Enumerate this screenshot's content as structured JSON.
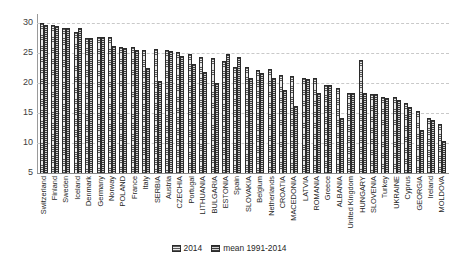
{
  "chart_data": {
    "type": "bar",
    "title": "",
    "subtitle": "",
    "xlabel": "",
    "ylabel": "",
    "ylim": [
      5,
      30
    ],
    "yticks": [
      30,
      25,
      20,
      15,
      10,
      5
    ],
    "grid": true,
    "legend_position": "bottom",
    "categories": [
      "Switzerland",
      "Finland",
      "Sweden",
      "Iceland",
      "Denmark",
      "Germany",
      "Norway",
      "POLAND",
      "France",
      "Italy",
      "SERBIA",
      "Austria",
      "CZECHIA",
      "Portugal",
      "LITHUANIA",
      "BULGARIA",
      "ESTONIA",
      "Spain",
      "SLOVAKIA",
      "Belgium",
      "Netherlands",
      "CROATIA",
      "MACEDONIA",
      "LATVIA",
      "ROMANIA",
      "Greece",
      "ALBANIA",
      "United Kingdom",
      "HUNGARY",
      "SLOVENIA",
      "Turkey",
      "UKRAINE",
      "Cyprus",
      "GEORGIA",
      "Ireland",
      "MOLDOVA"
    ],
    "series": [
      {
        "name": "2014",
        "color": "#e9e9e9",
        "values": [
          30.0,
          29.6,
          29.1,
          28.5,
          27.5,
          27.6,
          27.6,
          26.0,
          26.0,
          25.5,
          25.6,
          25.5,
          25.2,
          24.8,
          24.3,
          24.1,
          23.6,
          22.7,
          22.7,
          22.2,
          22.3,
          21.3,
          21.2,
          20.9,
          20.8,
          19.6,
          19.1,
          18.4,
          23.8,
          18.2,
          17.6,
          17.6,
          16.6,
          15.3,
          14.1,
          13.2
        ]
      },
      {
        "name": "mean 1991-2014",
        "color": "#d2d2d2",
        "values": [
          29.7,
          29.5,
          29.1,
          29.2,
          27.5,
          27.6,
          26.2,
          25.9,
          25.5,
          22.5,
          20.4,
          25.3,
          24.5,
          23.1,
          21.8,
          20.0,
          24.9,
          24.4,
          20.8,
          21.7,
          20.9,
          18.8,
          16.1,
          20.7,
          18.4,
          19.6,
          14.1,
          18.3,
          18.3,
          18.1,
          17.5,
          17.2,
          16.0,
          12.1,
          13.9,
          10.3
        ]
      }
    ]
  },
  "legend": {
    "items": [
      {
        "label": "2014"
      },
      {
        "label": "mean 1991-2014"
      }
    ]
  }
}
